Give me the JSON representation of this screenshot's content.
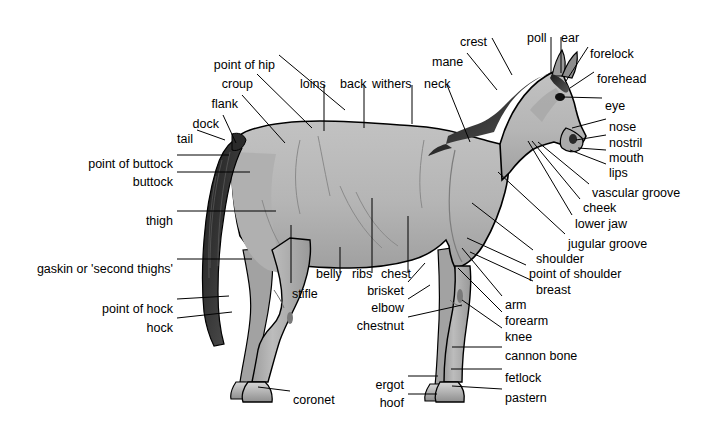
{
  "diagram": {
    "title": "",
    "background_color": "#ffffff",
    "body_fill_color": "#b5b5b5",
    "body_shade_color": "#9a9a9a",
    "outline_color": "#000000",
    "mane_tail_color": "#1a1a1a",
    "hoof_color": "#c9c9c9",
    "label_text_color": "#000000",
    "leader_line_color": "#000000"
  },
  "labels": [
    {
      "id": "point-of-hip",
      "text": "point of hip",
      "x": 275,
      "y": 59,
      "align": "end",
      "line": [
        [
          279,
          55
        ],
        [
          345,
          110
        ]
      ]
    },
    {
      "id": "croup",
      "text": "croup",
      "x": 253,
      "y": 78,
      "align": "end",
      "line": [
        [
          257,
          74
        ],
        [
          312,
          128
        ]
      ]
    },
    {
      "id": "loins",
      "text": "loins",
      "x": 300,
      "y": 78,
      "align": "start",
      "line": [
        [
          324,
          85
        ],
        [
          324,
          131
        ]
      ]
    },
    {
      "id": "back",
      "text": "back",
      "x": 340,
      "y": 78,
      "align": "start",
      "line": [
        [
          364,
          85
        ],
        [
          364,
          128
        ]
      ]
    },
    {
      "id": "withers",
      "text": "withers",
      "x": 372,
      "y": 78,
      "align": "start",
      "line": [
        [
          412,
          85
        ],
        [
          412,
          124
        ]
      ]
    },
    {
      "id": "neck",
      "text": "neck",
      "x": 424,
      "y": 78,
      "align": "start",
      "line": [
        [
          447,
          85
        ],
        [
          470,
          142
        ]
      ]
    },
    {
      "id": "mane",
      "text": "mane",
      "x": 432,
      "y": 56,
      "align": "start",
      "line": [
        [
          467,
          53
        ],
        [
          497,
          90
        ]
      ]
    },
    {
      "id": "crest",
      "text": "crest",
      "x": 460,
      "y": 36,
      "align": "start",
      "line": [
        [
          492,
          38
        ],
        [
          512,
          75
        ]
      ]
    },
    {
      "id": "poll",
      "text": "poll",
      "x": 527,
      "y": 32,
      "align": "start",
      "line": [
        [
          551,
          37
        ],
        [
          551,
          73
        ]
      ]
    },
    {
      "id": "ear",
      "text": "ear",
      "x": 561,
      "y": 32,
      "align": "start",
      "line": [
        [
          561,
          37
        ],
        [
          561,
          73
        ]
      ]
    },
    {
      "id": "forelock",
      "text": "forelock",
      "x": 590,
      "y": 48,
      "align": "start",
      "line": [
        [
          588,
          47
        ],
        [
          566,
          81
        ]
      ]
    },
    {
      "id": "forehead",
      "text": "forehead",
      "x": 597,
      "y": 73,
      "align": "start",
      "line": [
        [
          594,
          72
        ],
        [
          570,
          88
        ]
      ]
    },
    {
      "id": "eye",
      "text": "eye",
      "x": 605,
      "y": 100,
      "align": "start",
      "line": [
        [
          602,
          98
        ],
        [
          563,
          97
        ]
      ]
    },
    {
      "id": "nose",
      "text": "nose",
      "x": 609,
      "y": 121,
      "align": "start",
      "line": [
        [
          606,
          119
        ],
        [
          572,
          128
        ]
      ]
    },
    {
      "id": "nostril",
      "text": "nostril",
      "x": 609,
      "y": 137,
      "align": "start",
      "line": [
        [
          606,
          135
        ],
        [
          576,
          140
        ]
      ]
    },
    {
      "id": "mouth",
      "text": "mouth",
      "x": 609,
      "y": 152,
      "align": "start",
      "line": [
        [
          606,
          150
        ],
        [
          578,
          148
        ]
      ]
    },
    {
      "id": "lips",
      "text": "lips",
      "x": 609,
      "y": 167,
      "align": "start",
      "line": [
        [
          606,
          164
        ],
        [
          570,
          150
        ]
      ]
    },
    {
      "id": "vascular-groove",
      "text": "vascular groove",
      "x": 592,
      "y": 187,
      "align": "start",
      "line": [
        [
          589,
          184
        ],
        [
          538,
          142
        ]
      ]
    },
    {
      "id": "cheek",
      "text": "cheek",
      "x": 583,
      "y": 202,
      "align": "start",
      "line": [
        [
          580,
          199
        ],
        [
          532,
          141
        ]
      ]
    },
    {
      "id": "lower-jaw",
      "text": "lower jaw",
      "x": 575,
      "y": 218,
      "align": "start",
      "line": [
        [
          572,
          215
        ],
        [
          528,
          141
        ]
      ]
    },
    {
      "id": "jugular-groove",
      "text": "jugular groove",
      "x": 568,
      "y": 238,
      "align": "start",
      "line": [
        [
          565,
          234
        ],
        [
          498,
          172
        ]
      ]
    },
    {
      "id": "shoulder",
      "text": "shoulder",
      "x": 536,
      "y": 253,
      "align": "start",
      "line": [
        [
          533,
          250
        ],
        [
          472,
          203
        ]
      ]
    },
    {
      "id": "point-of-shoulder",
      "text": "point of shoulder",
      "x": 529,
      "y": 268,
      "align": "start",
      "line": [
        [
          526,
          265
        ],
        [
          467,
          238
        ]
      ]
    },
    {
      "id": "breast",
      "text": "breast",
      "x": 536,
      "y": 284,
      "align": "start",
      "line": [
        [
          533,
          281
        ],
        [
          470,
          252
        ]
      ]
    },
    {
      "id": "arm",
      "text": "arm",
      "x": 505,
      "y": 299,
      "align": "start",
      "line": [
        [
          502,
          296
        ],
        [
          462,
          248
        ]
      ]
    },
    {
      "id": "forearm",
      "text": "forearm",
      "x": 505,
      "y": 315,
      "align": "start",
      "line": [
        [
          502,
          312
        ],
        [
          458,
          268
        ]
      ]
    },
    {
      "id": "knee",
      "text": "knee",
      "x": 505,
      "y": 331,
      "align": "start",
      "line": [
        [
          502,
          328
        ],
        [
          462,
          300
        ]
      ]
    },
    {
      "id": "cannon-bone",
      "text": "cannon bone",
      "x": 505,
      "y": 350,
      "align": "start",
      "line": [
        [
          502,
          347
        ],
        [
          452,
          347
        ]
      ]
    },
    {
      "id": "fetlock",
      "text": "fetlock",
      "x": 505,
      "y": 372,
      "align": "start",
      "line": [
        [
          502,
          369
        ],
        [
          451,
          369
        ]
      ]
    },
    {
      "id": "pastern",
      "text": "pastern",
      "x": 505,
      "y": 392,
      "align": "start",
      "line": [
        [
          502,
          389
        ],
        [
          452,
          386
        ]
      ]
    },
    {
      "id": "ergot",
      "text": "ergot",
      "x": 404,
      "y": 379,
      "align": "end",
      "line": [
        [
          408,
          376
        ],
        [
          438,
          376
        ]
      ]
    },
    {
      "id": "hoof",
      "text": "hoof",
      "x": 404,
      "y": 397,
      "align": "end",
      "line": [
        [
          408,
          394
        ],
        [
          437,
          394
        ]
      ]
    },
    {
      "id": "chestnut",
      "text": "chestnut",
      "x": 404,
      "y": 320,
      "align": "end",
      "line": [
        [
          408,
          317
        ],
        [
          462,
          305
        ]
      ]
    },
    {
      "id": "elbow",
      "text": "elbow",
      "x": 404,
      "y": 302,
      "align": "end",
      "line": [
        [
          408,
          299
        ],
        [
          430,
          285
        ]
      ]
    },
    {
      "id": "brisket",
      "text": "brisket",
      "x": 404,
      "y": 285,
      "align": "end",
      "line": [
        [
          408,
          282
        ],
        [
          425,
          263
        ]
      ]
    },
    {
      "id": "chest",
      "text": "chest",
      "x": 381,
      "y": 268,
      "align": "start",
      "line": [
        [
          408,
          273
        ],
        [
          408,
          216
        ]
      ]
    },
    {
      "id": "ribs",
      "text": "ribs",
      "x": 352,
      "y": 268,
      "align": "start",
      "line": [
        [
          372,
          273
        ],
        [
          372,
          198
        ]
      ]
    },
    {
      "id": "belly",
      "text": "belly",
      "x": 316,
      "y": 268,
      "align": "start",
      "line": [
        [
          340,
          273
        ],
        [
          340,
          247
        ]
      ]
    },
    {
      "id": "stifle",
      "text": "stifle",
      "x": 292,
      "y": 288,
      "align": "start",
      "line": [
        [
          291,
          283
        ],
        [
          291,
          225
        ]
      ]
    },
    {
      "id": "coronet",
      "text": "coronet",
      "x": 293,
      "y": 394,
      "align": "start",
      "line": [
        [
          290,
          391
        ],
        [
          258,
          387
        ]
      ]
    },
    {
      "id": "hock",
      "text": "hock",
      "x": 173,
      "y": 322,
      "align": "end",
      "line": [
        [
          177,
          318
        ],
        [
          232,
          312
        ]
      ]
    },
    {
      "id": "point-of-hock",
      "text": "point of hock",
      "x": 173,
      "y": 303,
      "align": "end",
      "line": [
        [
          177,
          299
        ],
        [
          229,
          296
        ]
      ]
    },
    {
      "id": "gaskin",
      "text": "gaskin or 'second thighs'",
      "x": 173,
      "y": 263,
      "align": "end",
      "line": [
        [
          177,
          259
        ],
        [
          252,
          259
        ]
      ]
    },
    {
      "id": "thigh",
      "text": "thigh",
      "x": 173,
      "y": 215,
      "align": "end",
      "line": [
        [
          177,
          211
        ],
        [
          276,
          211
        ]
      ]
    },
    {
      "id": "buttock",
      "text": "buttock",
      "x": 173,
      "y": 176,
      "align": "end",
      "line": [
        [
          177,
          172
        ],
        [
          250,
          172
        ]
      ]
    },
    {
      "id": "point-of-buttock",
      "text": "point of buttock",
      "x": 173,
      "y": 158,
      "align": "end",
      "line": [
        [
          177,
          155
        ],
        [
          229,
          155
        ]
      ]
    },
    {
      "id": "tail",
      "text": "tail",
      "x": 193,
      "y": 133,
      "align": "end",
      "line": [
        [
          197,
          130
        ],
        [
          225,
          140
        ]
      ]
    },
    {
      "id": "dock",
      "text": "dock",
      "x": 219,
      "y": 118,
      "align": "end",
      "line": [
        [
          223,
          115
        ],
        [
          236,
          143
        ]
      ]
    },
    {
      "id": "flank",
      "text": "flank",
      "x": 238,
      "y": 98,
      "align": "end",
      "line": [
        [
          242,
          95
        ],
        [
          285,
          143
        ]
      ]
    }
  ]
}
